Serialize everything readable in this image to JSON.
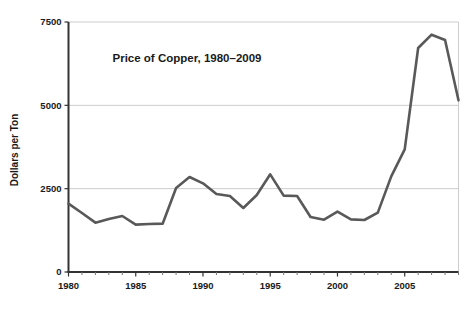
{
  "chart_data": {
    "type": "line",
    "title": "Price of Copper, 1980–2009",
    "xlabel": "",
    "ylabel": "Dollars per Ton",
    "xlim": [
      1980,
      2009
    ],
    "ylim": [
      0,
      7500
    ],
    "grid": true,
    "legend": null,
    "line_color": "#595959",
    "grid_color": "#cccccc",
    "axis_color": "#333333",
    "background": "#ffffff",
    "x_ticks_major": [
      "1980",
      "1985",
      "1990",
      "1995",
      "2000",
      "2005"
    ],
    "x_ticks_major_values": [
      1980,
      1985,
      1990,
      1995,
      2000,
      2005
    ],
    "x_ticks_minor_values": [
      1981,
      1982,
      1983,
      1984,
      1986,
      1987,
      1988,
      1989,
      1991,
      1992,
      1993,
      1994,
      1996,
      1997,
      1998,
      1999,
      2001,
      2002,
      2003,
      2004,
      2006,
      2007,
      2008,
      2009
    ],
    "y_ticks": [
      "0",
      "2500",
      "5000",
      "7500"
    ],
    "y_ticks_values": [
      0,
      2500,
      5000,
      7500
    ],
    "x": [
      1980,
      1981,
      1982,
      1983,
      1984,
      1985,
      1986,
      1987,
      1988,
      1989,
      1990,
      1991,
      1992,
      1993,
      1994,
      1995,
      1996,
      1997,
      1998,
      1999,
      2000,
      2001,
      2002,
      2003,
      2004,
      2005,
      2006,
      2007,
      2008,
      2009
    ],
    "series": [
      {
        "name": "Price of Copper",
        "values": [
          2050,
          1770,
          1480,
          1590,
          1680,
          1420,
          1440,
          1450,
          2520,
          2850,
          2660,
          2340,
          2280,
          1920,
          2310,
          2930,
          2290,
          2280,
          1650,
          1570,
          1810,
          1580,
          1560,
          1780,
          2870,
          3680,
          6720,
          7120,
          6960,
          5150
        ]
      }
    ]
  },
  "figure": {
    "title": "Price of Copper, 1980–2009",
    "y_axis_title": "Dollars per Ton"
  }
}
